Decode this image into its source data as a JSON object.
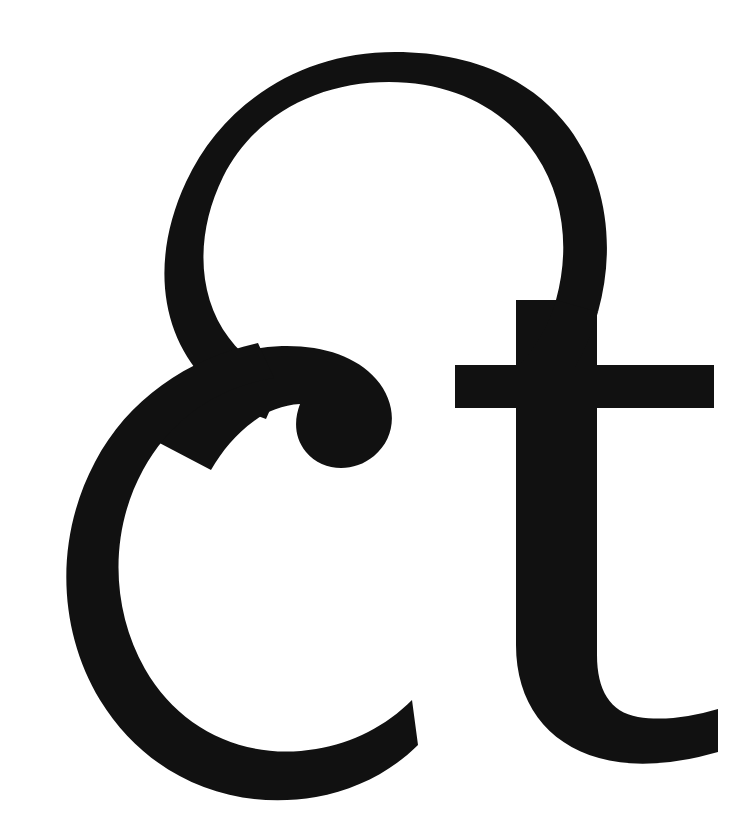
{
  "page": {
    "type": "typographic-specimen",
    "background_color": "#ffffff",
    "width": 756,
    "height": 826
  },
  "glyph": {
    "name": "et-ligature",
    "character": "&",
    "alt_text": "et",
    "description": "Large black italic et-ligature (ampersand) glyph occupying the full frame, partly cropped at the right edge",
    "color": "#111111",
    "style": "italic serif display",
    "components": [
      {
        "name": "upper-bowl",
        "label": "e"
      },
      {
        "name": "lower-bowl",
        "label": "c"
      },
      {
        "name": "arm-hook",
        "label": "arm"
      },
      {
        "name": "t-crossbar",
        "label": "t crossbar"
      },
      {
        "name": "t-stem",
        "label": "t stem"
      },
      {
        "name": "t-tail",
        "label": "t tail"
      }
    ],
    "bounds": {
      "left": 62,
      "top": 52,
      "right": 756,
      "bottom": 786
    },
    "metrics": {
      "upper_bowl_top": 52,
      "crossbar_top": 365,
      "crossbar_bottom": 408,
      "crossbar_left": 455,
      "crossbar_right": 714,
      "stem_left": 516,
      "stem_right": 597,
      "arm_tip_x": 392,
      "arm_tip_y": 398,
      "lower_bowl_bottom": 786,
      "tail_exit_x": 718,
      "tail_exit_y": 733
    }
  }
}
